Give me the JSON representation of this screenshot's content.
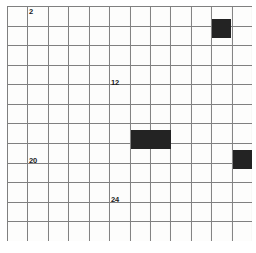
{
  "diagram": {
    "type": "grid",
    "columns": 12,
    "rows": 12,
    "origin_x": 7,
    "origin_y": 6,
    "cell_width": 20.42,
    "cell_height": 19.58,
    "line_color": "#808080",
    "line_width": 1,
    "background_color": "#fdfdfc",
    "fill_color": "#232323",
    "label_color": "#1a1a1a"
  },
  "labels": [
    {
      "text": "2",
      "col": 1,
      "row": 0,
      "dx": 2,
      "dy": 2
    },
    {
      "text": "12",
      "col": 5,
      "row": 3,
      "dx": 2,
      "dy": 14
    },
    {
      "text": "20",
      "col": 1,
      "row": 7,
      "dx": 2,
      "dy": 14
    },
    {
      "text": "24",
      "col": 5,
      "row": 9,
      "dx": 2,
      "dy": 14
    }
  ],
  "filled_cells": [
    {
      "col": 10,
      "row": 0,
      "span_x": 1,
      "span_y": 1,
      "offset_y": 12
    },
    {
      "col": 6,
      "row": 6,
      "span_x": 2,
      "span_y": 1,
      "offset_y": 6
    },
    {
      "col": 11,
      "row": 7,
      "span_x": 1,
      "span_y": 1,
      "offset_y": 6
    }
  ]
}
